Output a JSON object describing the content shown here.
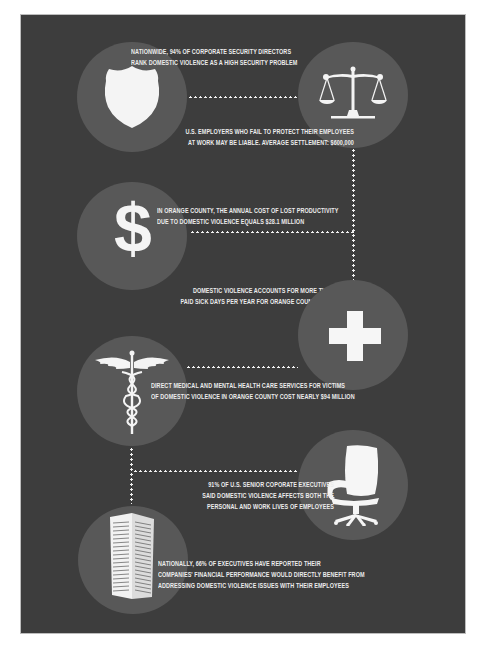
{
  "colors": {
    "page_background": "#ffffff",
    "panel_background": "#3d3d3d",
    "circle_fill": "#585858",
    "icon_and_text": "#ececec"
  },
  "items": [
    {
      "icon": "shield-icon",
      "lines": [
        "Nationwide, 94% of corporate security directors",
        "rank domestic violence as a high security problem"
      ]
    },
    {
      "icon": "scales-of-justice-icon",
      "lines": [
        "U.S. employers who fail to protect their employees",
        "at work may be liable. Average settlement: $600,000"
      ]
    },
    {
      "icon": "dollar-sign-icon",
      "lines": [
        "In Orange County, the annual cost of lost productivity",
        "due to domestic violence equals $28.1 million"
      ]
    },
    {
      "icon": "medical-cross-icon",
      "lines": [
        "Domestic violence accounts for more than 210,000",
        "paid sick days per year for Orange County employers"
      ]
    },
    {
      "icon": "caduceus-icon",
      "lines": [
        "Direct medical and mental health care services for victims",
        "of domestic violence in Orange County cost nearly $94 million"
      ]
    },
    {
      "icon": "office-chair-icon",
      "lines": [
        "91% of U.S. senior coporate executives",
        "said domestic violence affects both the",
        "personal and work lives of employees"
      ]
    },
    {
      "icon": "office-building-icon",
      "lines": [
        "Nationally, 66% of executives have reported their",
        "companies' financial performance would directly benefit from",
        "addressing domestic violence issues with their employees"
      ]
    }
  ]
}
